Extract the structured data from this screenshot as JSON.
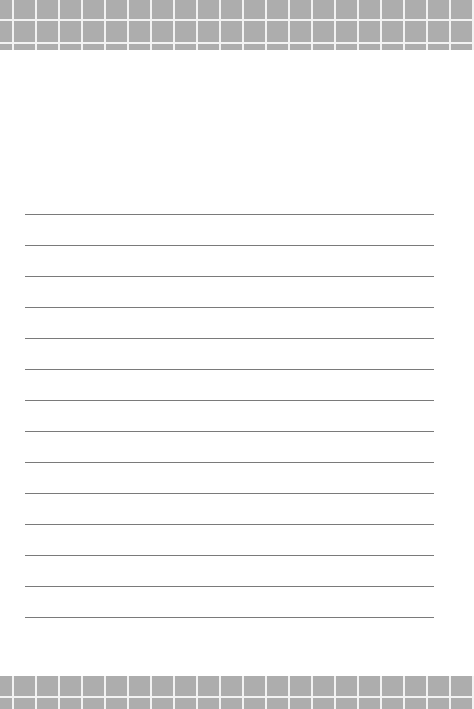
{
  "page": {
    "type": "lined-paper",
    "background_color": "#ffffff",
    "band_color": "#adadad",
    "band_grid_line_color": "#f2f2f2",
    "rule_color": "#7a7a7a",
    "rule_count": 14,
    "rule_positions_y": [
      214,
      245,
      276,
      307,
      338,
      369,
      400,
      431,
      462,
      493,
      524,
      555,
      586,
      617
    ]
  }
}
